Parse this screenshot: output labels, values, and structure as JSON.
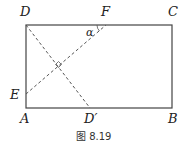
{
  "figure": {
    "caption": "图 8.19",
    "points": {
      "D": "D",
      "F": "F",
      "C": "C",
      "E": "E",
      "A": "A",
      "D_prime": "D′",
      "B": "B"
    },
    "angle_label": "α",
    "colors": {
      "line": "#444444",
      "dashed": "#555555"
    }
  }
}
